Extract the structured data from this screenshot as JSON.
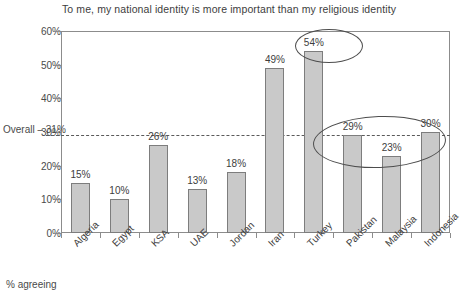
{
  "chart_data": {
    "type": "bar",
    "title": "To me, my national identity is more important than my religious identity",
    "xlabel": "",
    "ylabel": "",
    "ylim": [
      0,
      60
    ],
    "grid": false,
    "legend": null,
    "footnote": "% agreeing",
    "categories": [
      "Algeria",
      "Egypt",
      "KSA",
      "UAE",
      "Jordan",
      "Iran",
      "Turkey",
      "Pakistan",
      "Malaysia",
      "Indonesia"
    ],
    "values": [
      15,
      10,
      26,
      13,
      18,
      49,
      54,
      29,
      23,
      30
    ],
    "value_labels": [
      "15%",
      "10%",
      "26%",
      "13%",
      "18%",
      "49%",
      "54%",
      "29%",
      "23%",
      "30%"
    ],
    "y_ticks": [
      0,
      10,
      20,
      30,
      40,
      50,
      60
    ],
    "y_tick_labels": [
      "0%",
      "10%",
      "20%",
      "30%",
      "40%",
      "50%",
      "60%"
    ],
    "reference_line": {
      "label": "Overall – 31%",
      "value": 31
    },
    "annotations": [
      {
        "name": "highlight-turkey",
        "target": "Turkey",
        "shape": "ellipse"
      },
      {
        "name": "highlight-pakistan-malaysia-indonesia",
        "target": "Pakistan, Malaysia, Indonesia",
        "shape": "ellipse"
      }
    ],
    "colors": {
      "bar_fill": "#c9c9c9",
      "bar_stroke": "#7d7d7d",
      "axis": "#8c8c8c",
      "text": "#3d3d3d",
      "reference_line": "#5a5a5a",
      "annotation": "#4d4d4d"
    }
  }
}
